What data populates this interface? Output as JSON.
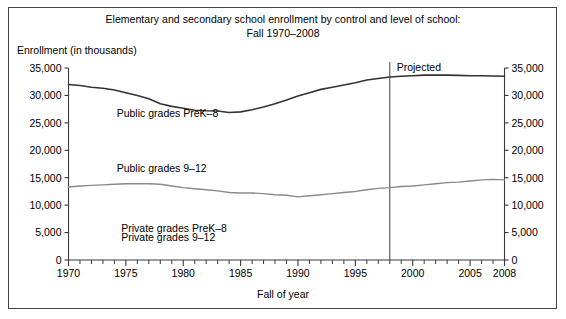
{
  "figure": {
    "title_line1": "Elementary and secondary school enrollment by control and level of school:",
    "title_line2": "Fall 1970–2008",
    "y_axis_note": "Enrollment (in thousands)",
    "x_axis_label": "Fall of year",
    "projected_label": "Projected"
  },
  "chart_data": {
    "type": "line",
    "title": "Elementary and secondary school enrollment by control and level of school: Fall 1970–2008",
    "xlabel": "Fall of year",
    "ylabel": "Enrollment (in thousands)",
    "xlim": [
      1970,
      2008
    ],
    "ylim": [
      0,
      35000
    ],
    "ytick_values": [
      0,
      5000,
      10000,
      15000,
      20000,
      25000,
      30000,
      35000
    ],
    "ytick_labels": [
      "0",
      "5,000",
      "10,000",
      "15,000",
      "20,000",
      "25,000",
      "30,000",
      "35,000"
    ],
    "ytick_labels_right": [
      "0",
      "5,000",
      "10,000",
      "15,000",
      "20,000",
      "25,000",
      "30,000",
      "35,000"
    ],
    "xtick_major": [
      1970,
      1975,
      1980,
      1985,
      1990,
      1995,
      2000,
      2005,
      2008
    ],
    "xtick_major_labels": [
      "1970",
      "1975",
      "1980",
      "1985",
      "1990",
      "1995",
      "2000",
      "2005",
      "2008"
    ],
    "xtick_minor_step": 1,
    "grid": false,
    "legend_position": "inline-annotations",
    "annotations": [
      {
        "text": "Public grades PreK–8",
        "x": 1974.2,
        "y": 26100
      },
      {
        "text": "Public grades 9–12",
        "x": 1974.2,
        "y": 16100
      },
      {
        "text": "Private grades PreK–8",
        "x": 1974.6,
        "y": 5100
      },
      {
        "text": "Private grades 9–12",
        "x": 1974.6,
        "y": 3400
      },
      {
        "text": "Projected",
        "x": 1998.6,
        "y": 34400
      }
    ],
    "projection_divider_year": 1998,
    "x": [
      1970,
      1971,
      1972,
      1973,
      1974,
      1975,
      1976,
      1977,
      1978,
      1979,
      1980,
      1981,
      1982,
      1983,
      1984,
      1985,
      1986,
      1987,
      1988,
      1989,
      1990,
      1991,
      1992,
      1993,
      1994,
      1995,
      1996,
      1997,
      1998,
      1999,
      2000,
      2001,
      2002,
      2003,
      2004,
      2005,
      2006,
      2007,
      2008
    ],
    "series": [
      {
        "name": "Public grades PreK–8",
        "color": "#333333",
        "width": 1.6,
        "values": [
          32000,
          31800,
          31500,
          31300,
          31000,
          30500,
          30000,
          29400,
          28500,
          28000,
          27650,
          27300,
          27200,
          27150,
          26900,
          27000,
          27400,
          27900,
          28500,
          29150,
          29900,
          30500,
          31100,
          31500,
          31900,
          32300,
          32800,
          33100,
          33350,
          33500,
          33600,
          33700,
          33700,
          33700,
          33650,
          33600,
          33600,
          33550,
          33500
        ]
      },
      {
        "name": "Public grades 9–12",
        "color": "#8a8a8a",
        "width": 1.4,
        "values": [
          13300,
          13500,
          13600,
          13700,
          13800,
          13900,
          13900,
          13900,
          13800,
          13500,
          13200,
          13000,
          12800,
          12600,
          12300,
          12200,
          12200,
          12100,
          11900,
          11800,
          11500,
          11700,
          11900,
          12100,
          12300,
          12500,
          12800,
          13050,
          13200,
          13400,
          13500,
          13700,
          13900,
          14100,
          14200,
          14400,
          14600,
          14700,
          14600
        ]
      }
    ]
  }
}
